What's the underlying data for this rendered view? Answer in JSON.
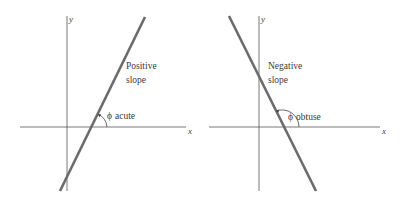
{
  "panels": [
    {
      "id": "positive",
      "axis_labels": {
        "x": "x",
        "y": "y"
      },
      "slope_label_line1": "Positive",
      "slope_label_line2": "slope",
      "angle_symbol": "ϕ",
      "angle_label": "acute"
    },
    {
      "id": "negative",
      "axis_labels": {
        "x": "x",
        "y": "y"
      },
      "slope_label_line1": "Negative",
      "slope_label_line2": "slope",
      "angle_symbol": "ϕ",
      "angle_label": "obtuse"
    }
  ],
  "colors": {
    "axis": "#555555",
    "line": "#6b6b6b",
    "text": "#3a3a3a"
  }
}
